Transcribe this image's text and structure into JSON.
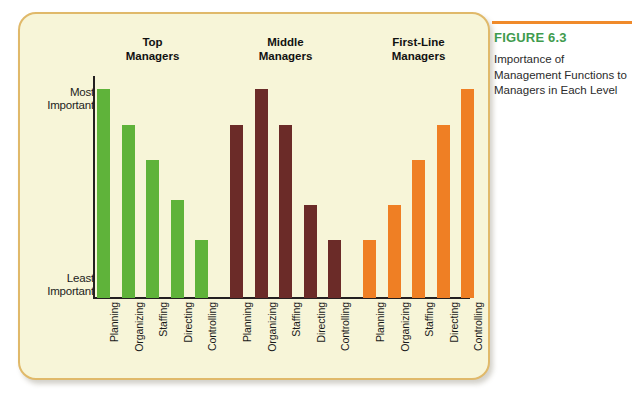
{
  "caption": {
    "figure_number": "FIGURE 6.3",
    "text": "Importance of Management Functions to Managers in Each Level",
    "rule_color": "#f08a2a",
    "number_color": "#3f9b4e"
  },
  "card": {
    "background": "#f7f5d8",
    "border_color": "#e0b96a"
  },
  "axis": {
    "top_label_line1": "Most",
    "top_label_line2": "Important",
    "bottom_label_line1": "Least",
    "bottom_label_line2": "Important"
  },
  "chart_data": {
    "type": "bar",
    "title": "Importance of Management Functions to Managers in Each Level",
    "xlabel": "",
    "ylabel": "Importance",
    "ylim": [
      0,
      100
    ],
    "grid": false,
    "legend": "none",
    "ytick_labels": [
      "Least Important",
      "Most Important"
    ],
    "categories": [
      "Planning",
      "Organizing",
      "Staffing",
      "Directing",
      "Controlling"
    ],
    "groups": [
      "Top Managers",
      "Middle Managers",
      "First-Line Managers"
    ],
    "group_labels": [
      {
        "line1": "Top",
        "line2": "Managers"
      },
      {
        "line1": "Middle",
        "line2": "Managers"
      },
      {
        "line1": "First-Line",
        "line2": "Managers"
      }
    ],
    "series": [
      {
        "name": "Top Managers",
        "color": "#5fb33a",
        "values": [
          94,
          78,
          62,
          44,
          26
        ]
      },
      {
        "name": "Middle Managers",
        "color": "#6b2b28",
        "values": [
          78,
          94,
          78,
          42,
          26
        ]
      },
      {
        "name": "First-Line Managers",
        "color": "#ef7f24",
        "values": [
          26,
          42,
          62,
          78,
          94
        ]
      }
    ],
    "bar_labels": [
      "Planning",
      "Organizing",
      "Staffing",
      "Directing",
      "Controlling",
      "Planning",
      "Organizing",
      "Staffing",
      "Directing",
      "Controlling",
      "Planning",
      "Organizing",
      "Staffing",
      "Directing",
      "Controlling"
    ]
  }
}
